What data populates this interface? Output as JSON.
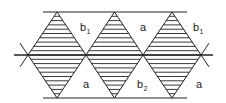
{
  "diagram": {
    "stroke_color": "#222222",
    "background": "#ffffff",
    "rails": {
      "top_y": 12,
      "bottom_y": 98,
      "mid_y": 55,
      "rail_x_start": 43,
      "rail_x_end": 187,
      "mid_x_start": 14,
      "mid_x_end": 213
    },
    "diamonds": [
      {
        "cx": 57,
        "half_width": 29
      },
      {
        "cx": 114.5,
        "half_width": 28.5
      },
      {
        "cx": 172,
        "half_width": 29
      }
    ],
    "hatch_spacing": 4.3,
    "labels_top": [
      {
        "base": "b",
        "sub": "1",
        "x": 80,
        "y": 31
      },
      {
        "base": "a",
        "sub": "",
        "x": 140,
        "y": 31
      },
      {
        "base": "b",
        "sub": "1",
        "x": 193,
        "y": 31
      }
    ],
    "labels_bottom": [
      {
        "base": "a",
        "sub": "",
        "x": 83,
        "y": 88
      },
      {
        "base": "b",
        "sub": "2",
        "x": 137,
        "y": 88
      },
      {
        "base": "a",
        "sub": "",
        "x": 196,
        "y": 88
      }
    ]
  }
}
